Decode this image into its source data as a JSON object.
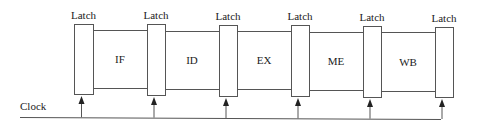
{
  "diagram": {
    "title": "",
    "clock_label": "Clock",
    "latch_label": "Latch",
    "colors": {
      "stroke": "#555555",
      "text": "#222222",
      "background": "#ffffff"
    },
    "latches": [
      {
        "label": "Latch",
        "x": 74,
        "y": 24,
        "w": 19,
        "h": 70
      },
      {
        "label": "Latch",
        "x": 147,
        "y": 24,
        "w": 18,
        "h": 71
      },
      {
        "label": "Latch",
        "x": 219,
        "y": 25,
        "w": 18,
        "h": 71
      },
      {
        "label": "Latch",
        "x": 291,
        "y": 25,
        "w": 18,
        "h": 71
      },
      {
        "label": "Latch",
        "x": 363,
        "y": 26,
        "w": 18,
        "h": 71
      },
      {
        "label": "Latch",
        "x": 435,
        "y": 27,
        "w": 18,
        "h": 70
      }
    ],
    "stages": [
      {
        "label": "IF",
        "x1": 93,
        "x2": 147,
        "top": 30,
        "bottom": 88
      },
      {
        "label": "ID",
        "x1": 165,
        "x2": 219,
        "top": 31,
        "bottom": 89
      },
      {
        "label": "EX",
        "x1": 237,
        "x2": 291,
        "top": 31,
        "bottom": 89
      },
      {
        "label": "ME",
        "x1": 309,
        "x2": 363,
        "top": 32,
        "bottom": 90
      },
      {
        "label": "WB",
        "x1": 381,
        "x2": 435,
        "top": 32,
        "bottom": 91
      }
    ],
    "clock": {
      "x1": 20,
      "y1": 117,
      "x2": 441,
      "y2": 119,
      "label_x": 20,
      "label_y": 101
    }
  }
}
